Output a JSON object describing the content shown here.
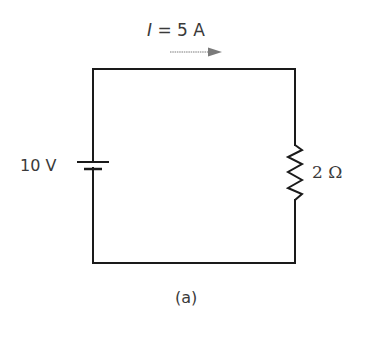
{
  "diagram": {
    "type": "circuit",
    "current_label": {
      "symbol": "I",
      "rest": " = 5 A"
    },
    "current_arrow": "right",
    "source": {
      "kind": "battery",
      "label": "10 V"
    },
    "load": {
      "kind": "resistor",
      "label": "2 Ω"
    },
    "caption": "(a)"
  },
  "colors": {
    "wire": "#1a1a1a",
    "text": "#3a3a3a",
    "arrow": "#7a7a7a"
  }
}
